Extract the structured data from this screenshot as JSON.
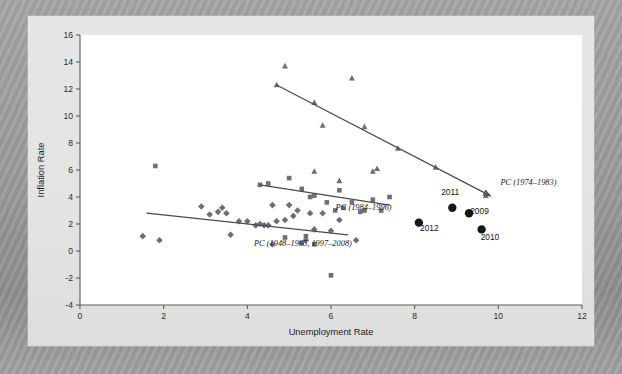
{
  "figure": {
    "background_color": "#9a9a9a",
    "panel_color": "#e4e4e2",
    "plot_color": "#ffffff"
  },
  "chart_data": {
    "type": "scatter",
    "title": "",
    "xlabel": "Unemployment Rate",
    "ylabel": "Inflation Rate",
    "xlim": [
      0,
      12
    ],
    "ylim": [
      -4,
      16
    ],
    "xticks": [
      0,
      2,
      4,
      6,
      8,
      10,
      12
    ],
    "yticks": [
      -4,
      -2,
      0,
      2,
      4,
      6,
      8,
      10,
      12,
      14,
      16
    ],
    "grid": false,
    "legend_position": "inline-annotations",
    "marker_colors": {
      "diamond": "#6e6e79",
      "square": "#6e6e79",
      "triangle": "#6e6e79",
      "circle": "#17171a",
      "trendline": "#4a4a52"
    },
    "series": [
      {
        "name": "PC (1948-1965, 1997-2008)",
        "marker": "diamond",
        "points": [
          [
            1.5,
            1.1
          ],
          [
            1.9,
            0.8
          ],
          [
            2.9,
            3.3
          ],
          [
            3.1,
            2.7
          ],
          [
            3.3,
            2.9
          ],
          [
            3.4,
            3.2
          ],
          [
            3.5,
            2.8
          ],
          [
            3.6,
            1.2
          ],
          [
            3.8,
            2.2
          ],
          [
            4.0,
            2.2
          ],
          [
            4.2,
            1.9
          ],
          [
            4.3,
            2.0
          ],
          [
            4.4,
            1.9
          ],
          [
            4.5,
            1.9
          ],
          [
            4.6,
            3.4
          ],
          [
            4.7,
            2.2
          ],
          [
            4.9,
            2.3
          ],
          [
            5.0,
            3.4
          ],
          [
            5.1,
            2.6
          ],
          [
            5.2,
            3.0
          ],
          [
            5.4,
            0.8
          ],
          [
            5.5,
            2.8
          ],
          [
            5.6,
            1.6
          ],
          [
            5.8,
            2.8
          ],
          [
            6.0,
            1.5
          ],
          [
            6.2,
            2.3
          ],
          [
            6.6,
            0.8
          ],
          [
            4.6,
            0.5
          ]
        ]
      },
      {
        "name": "PC (1984-1996)",
        "marker": "square",
        "points": [
          [
            1.8,
            6.3
          ],
          [
            4.3,
            4.9
          ],
          [
            4.5,
            5.0
          ],
          [
            5.0,
            5.4
          ],
          [
            5.3,
            4.6
          ],
          [
            5.5,
            4.0
          ],
          [
            5.6,
            4.1
          ],
          [
            5.9,
            3.6
          ],
          [
            6.1,
            3.0
          ],
          [
            6.2,
            4.5
          ],
          [
            6.3,
            3.2
          ],
          [
            6.5,
            3.6
          ],
          [
            6.7,
            2.9
          ],
          [
            6.8,
            3.0
          ],
          [
            7.0,
            3.8
          ],
          [
            7.2,
            3.0
          ],
          [
            7.4,
            4.0
          ],
          [
            5.4,
            1.1
          ],
          [
            5.6,
            0.5
          ],
          [
            6.0,
            -1.8
          ],
          [
            4.9,
            1.0
          ],
          [
            5.3,
            0.6
          ]
        ]
      },
      {
        "name": "PC (1974-1983)",
        "marker": "triangle",
        "points": [
          [
            4.9,
            13.7
          ],
          [
            5.6,
            11.0
          ],
          [
            5.8,
            9.3
          ],
          [
            6.5,
            12.8
          ],
          [
            6.8,
            9.2
          ],
          [
            7.1,
            6.1
          ],
          [
            7.6,
            7.6
          ],
          [
            5.6,
            5.9
          ],
          [
            6.2,
            5.2
          ],
          [
            7.0,
            5.9
          ],
          [
            8.5,
            6.2
          ],
          [
            9.7,
            4.1
          ],
          [
            4.7,
            12.3
          ]
        ]
      },
      {
        "name": "Recent years",
        "marker": "circle",
        "points": [
          [
            8.9,
            3.2
          ],
          [
            9.3,
            2.8
          ],
          [
            9.6,
            1.6
          ],
          [
            8.1,
            2.1
          ]
        ],
        "labels": [
          "2011",
          "2009",
          "2010",
          "2012"
        ]
      }
    ],
    "trendlines": [
      {
        "name": "PC (1974-1983)",
        "x1": 4.7,
        "y1": 12.3,
        "x2": 9.8,
        "y2": 4.1,
        "label": "PC (1974–1983)"
      },
      {
        "name": "PC (1984-1996)",
        "x1": 4.3,
        "y1": 4.9,
        "x2": 7.4,
        "y2": 3.4,
        "label": "PC (1984–1996)"
      },
      {
        "name": "PC (1948-1965, 1997-2008)",
        "x1": 1.6,
        "y1": 2.8,
        "x2": 6.4,
        "y2": 1.2,
        "label": "PC (1948–1965, 1997–2008)"
      }
    ],
    "annotations": [
      {
        "text": "PC (1974–1983)",
        "x": 10.05,
        "y": 4.9
      },
      {
        "text": "PC (1984–1996)",
        "x": 7.45,
        "y": 3.05
      },
      {
        "text": "PC (1948–1965, 1997–2008)",
        "x": 6.5,
        "y": 0.35
      },
      {
        "text": "2011",
        "x": 8.85,
        "y": 4.15
      },
      {
        "text": "2009",
        "x": 9.55,
        "y": 2.75
      },
      {
        "text": "2010",
        "x": 9.8,
        "y": 0.8
      },
      {
        "text": "2012",
        "x": 8.35,
        "y": 1.45
      }
    ]
  }
}
